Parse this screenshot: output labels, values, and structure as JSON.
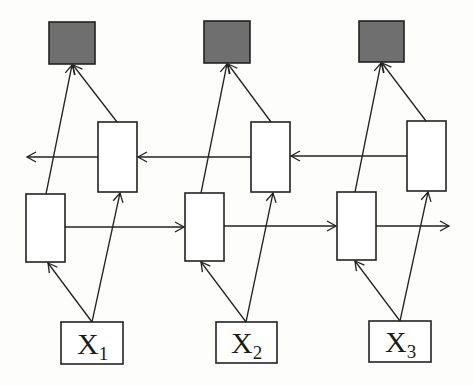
{
  "diagram": {
    "type": "bidirectional-rnn",
    "colors": {
      "output_fill": "#6f6f6f",
      "stroke": "#222222",
      "background": "#fdfdfc"
    },
    "inputs": [
      {
        "base": "X",
        "sub": "1"
      },
      {
        "base": "X",
        "sub": "2"
      },
      {
        "base": "X",
        "sub": "3"
      }
    ],
    "outputs": [
      "output-1",
      "output-2",
      "output-3"
    ],
    "forward_states": [
      "forward-1",
      "forward-2",
      "forward-3"
    ],
    "backward_states": [
      "backward-1",
      "backward-2",
      "backward-3"
    ]
  }
}
